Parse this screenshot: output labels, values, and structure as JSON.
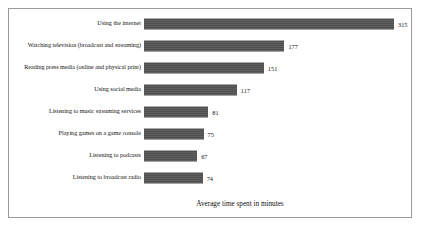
{
  "chart_data": {
    "type": "bar",
    "orientation": "horizontal",
    "title": "",
    "xlabel": "Average time spent in minutes",
    "ylabel": "",
    "categories": [
      "Using the internet",
      "Watching television (broadcast and streaming)",
      "Reading press media (online and physical print)",
      "Using social media",
      "Listening to music streaming services",
      "Playing games on a game console",
      "Listening to podcasts",
      "Listening to broadcast radio"
    ],
    "values": [
      315,
      177,
      151,
      117,
      81,
      75,
      67,
      74
    ],
    "value_labels": [
      "315",
      "177",
      "151",
      "117",
      "81",
      "75",
      "67",
      "74"
    ],
    "xlim": [
      0,
      315
    ],
    "grid": false,
    "legend": false,
    "bar_color": "#565656",
    "frame_color": "#9a9a9a",
    "text_color": "#101010"
  },
  "axis": {
    "title": "Average time spent in minutes"
  },
  "rows": [
    {
      "label": "Using the internet",
      "value": 315,
      "value_label": "315"
    },
    {
      "label": "Watching television (broadcast and streaming)",
      "value": 177,
      "value_label": "177"
    },
    {
      "label": "Reading press media (online and physical print)",
      "value": 151,
      "value_label": "151"
    },
    {
      "label": "Using social media",
      "value": 117,
      "value_label": "117"
    },
    {
      "label": "Listening to music streaming services",
      "value": 81,
      "value_label": "81"
    },
    {
      "label": "Playing games on a game console",
      "value": 75,
      "value_label": "75"
    },
    {
      "label": "Listening to podcasts",
      "value": 67,
      "value_label": "67"
    },
    {
      "label": "Listening to broadcast radio",
      "value": 74,
      "value_label": "74"
    }
  ]
}
